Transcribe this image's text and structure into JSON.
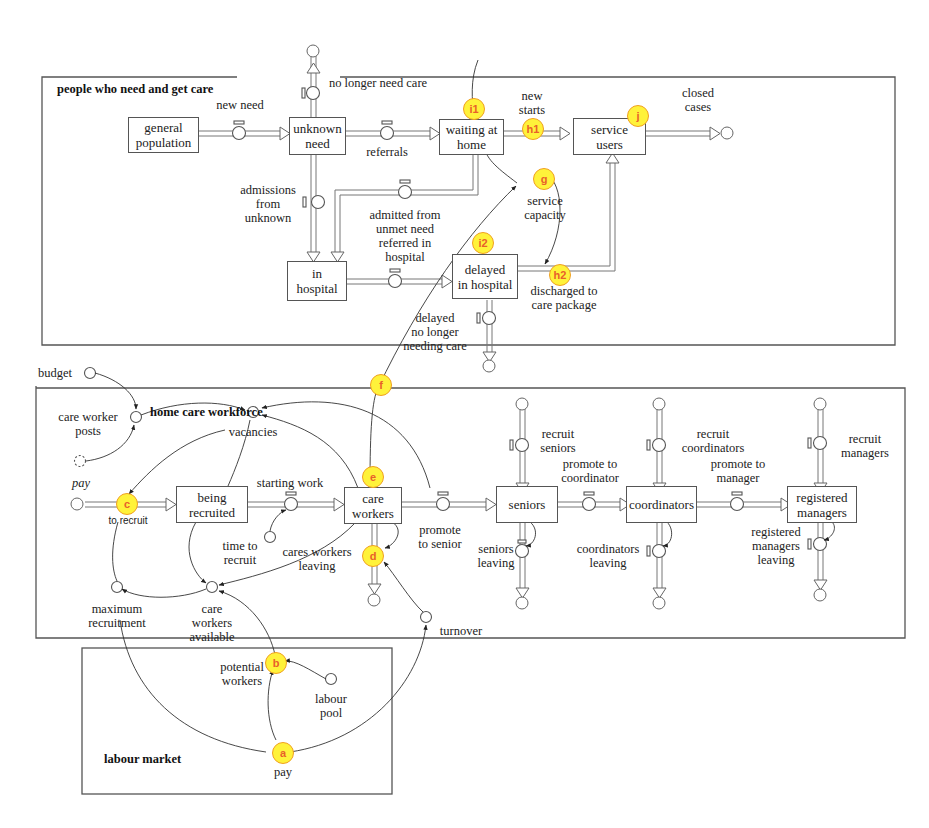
{
  "sectors": {
    "care": {
      "title": "people who need and get care"
    },
    "workforce": {
      "title": "home care workforce"
    },
    "labour": {
      "title": "labour market"
    }
  },
  "stocks": {
    "general_population": "general\npopulation",
    "unknown_need": "unknown\nneed",
    "waiting_at_home": "waiting at\nhome",
    "service_users": "service\nusers",
    "in_hospital": "in\nhospital",
    "delayed_in_hospital": "delayed\nin hospital",
    "being_recruited": "being\nrecruited",
    "care_workers": "care\nworkers",
    "seniors": "seniors",
    "coordinators": "coordinators",
    "registered_managers": "registered\nmanagers"
  },
  "flows": {
    "new_need": "new need",
    "no_longer_need_care": "no longer need care",
    "referrals": "referrals",
    "new_starts": "new\nstarts",
    "closed_cases": "closed\ncases",
    "admissions_from_unknown": "admissions\nfrom\nunknown",
    "admitted_from_unmet": "admitted from\nunmet need\nreferred in\nhospital",
    "discharged_to_care_package": "discharged to\ncare package",
    "delayed_no_longer": "delayed\nno longer\nneeding care",
    "to_recruit": "to recruit",
    "starting_work": "starting work",
    "cares_workers_leaving": "cares workers\nleaving",
    "promote_to_senior": "promote\nto senior",
    "recruit_seniors": "recruit\nseniors",
    "seniors_leaving": "seniors\nleaving",
    "promote_to_coordinator": "promote to\ncoordinator",
    "recruit_coordinators": "recruit\ncoordinators",
    "coordinators_leaving": "coordinators\nleaving",
    "promote_to_manager": "promote to\nmanager",
    "recruit_managers": "recruit\nmanagers",
    "registered_managers_leaving": "registered\nmanagers\nleaving"
  },
  "auxiliaries": {
    "service_capacity": "service\ncapacity",
    "budget": "budget",
    "care_worker_posts": "care worker\nposts",
    "pay_ghost": "pay",
    "vacancies": "vacancies",
    "time_to_recruit": "time to\nrecruit",
    "maximum_recruitment": "maximum\nrecruitment",
    "care_workers_available": "care\nworkers\navailable",
    "turnover": "turnover",
    "potential_workers": "potential\nworkers",
    "labour_pool": "labour\npool",
    "pay": "pay"
  },
  "markers": {
    "a": "a",
    "b": "b",
    "c": "c",
    "d": "d",
    "e": "e",
    "f": "f",
    "g": "g",
    "h1": "h1",
    "h2": "h2",
    "i1": "i1",
    "i2": "i2",
    "j": "j"
  },
  "colors": {
    "marker_fill": "#fff23a",
    "marker_border": "#f0a020",
    "marker_text": "#e8602a",
    "line": "#555555"
  }
}
